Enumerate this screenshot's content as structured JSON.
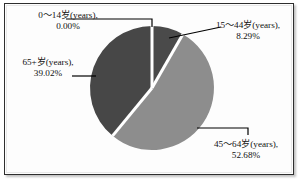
{
  "figure": {
    "background_color": "#ffffff",
    "frame_color": "#2e2e2e"
  },
  "chart_data": {
    "type": "pie",
    "title": "",
    "subtitle": "",
    "xlabel": "",
    "ylabel": "",
    "legend_position": "none",
    "grid": false,
    "label_format": "{category}, {value}%",
    "start_angle_deg": 0,
    "direction": "clockwise",
    "categories": [
      "0～14岁(years)",
      "15～44岁(years)",
      "45～64岁(years)",
      "65+岁(years)"
    ],
    "values": [
      0.0,
      8.29,
      52.68,
      39.02
    ],
    "value_labels": [
      "0.00%",
      "8.29%",
      "52.68%",
      "39.02%"
    ],
    "colors": [
      "#ffffff",
      "#4a4a4a",
      "#8d8d8d",
      "#474747"
    ],
    "slices": [
      {
        "category": "0～14岁(years)",
        "value": 0.0,
        "value_label": "0.00%",
        "color": "#ffffff",
        "label_line1": "0～14岁(years),",
        "label_line2": "0.00%"
      },
      {
        "category": "15～44岁(years)",
        "value": 8.29,
        "value_label": "8.29%",
        "color": "#4a4a4a",
        "label_line1": "15～44岁(years),",
        "label_line2": "8.29%"
      },
      {
        "category": "45～64岁(years)",
        "value": 52.68,
        "value_label": "52.68%",
        "color": "#8d8d8d",
        "label_line1": "45～64岁(years),",
        "label_line2": "52.68%"
      },
      {
        "category": "65+岁(years)",
        "value": 39.02,
        "value_label": "39.02%",
        "color": "#474747",
        "label_line1": "65+岁(years),",
        "label_line2": "39.02%"
      }
    ]
  }
}
